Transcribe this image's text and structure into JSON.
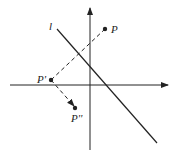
{
  "diagram": {
    "type": "reflection-composition",
    "colors": {
      "ink": "#222222",
      "background": "#ffffff"
    },
    "axes": {
      "x_axis": {
        "from": [
          10,
          85
        ],
        "to": [
          168,
          85
        ],
        "arrow": true
      },
      "y_axis": {
        "from": [
          90,
          150
        ],
        "to": [
          90,
          8
        ],
        "arrow": true
      }
    },
    "line_l": {
      "label": "l",
      "from": [
        57,
        29
      ],
      "to": [
        157,
        143
      ],
      "label_pos": [
        49,
        29
      ]
    },
    "points": [
      {
        "id": "P",
        "label": "P",
        "pos": [
          105,
          29
        ],
        "label_pos": [
          111,
          33
        ]
      },
      {
        "id": "P1",
        "label": "P'",
        "pos": [
          51,
          80
        ],
        "label_pos": [
          37,
          83
        ]
      },
      {
        "id": "P2",
        "label": "P''",
        "pos": [
          75,
          108
        ],
        "label_pos": [
          71,
          122
        ]
      }
    ],
    "dashed_segments": [
      {
        "from": "P",
        "to": "P1"
      },
      {
        "from": "P1",
        "to": "P2",
        "arrow": true
      }
    ]
  }
}
